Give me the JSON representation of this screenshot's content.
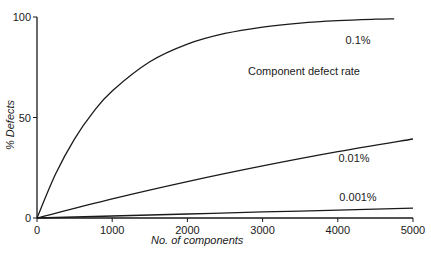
{
  "chart_data": {
    "type": "line",
    "title": "",
    "xlabel": "No. of components",
    "ylabel": "% Defects",
    "xlim": [
      0,
      5000
    ],
    "ylim": [
      0,
      100
    ],
    "x_ticks": [
      0,
      1000,
      2000,
      3000,
      4000,
      5000
    ],
    "y_ticks": [
      0,
      50,
      100
    ],
    "grid": false,
    "legend_title": "Component defect rate",
    "series": [
      {
        "name": "0.1%",
        "label": "0.1%",
        "x": [
          0,
          250,
          500,
          750,
          1000,
          1500,
          2000,
          2500,
          3000,
          3500,
          4000,
          4500,
          4750
        ],
        "values": [
          0,
          22.1,
          39.4,
          52.8,
          63.2,
          77.7,
          86.5,
          91.8,
          95.0,
          97.0,
          98.2,
          98.9,
          99.1
        ]
      },
      {
        "name": "0.01%",
        "label": "0.01%",
        "x": [
          0,
          1000,
          2000,
          3000,
          4000,
          5000
        ],
        "values": [
          0,
          9.5,
          18.1,
          25.9,
          33.0,
          39.3
        ]
      },
      {
        "name": "0.001%",
        "label": "0.001%",
        "x": [
          0,
          1000,
          2000,
          3000,
          4000,
          5000
        ],
        "values": [
          0,
          1.0,
          2.0,
          3.0,
          3.9,
          4.9
        ]
      }
    ]
  }
}
